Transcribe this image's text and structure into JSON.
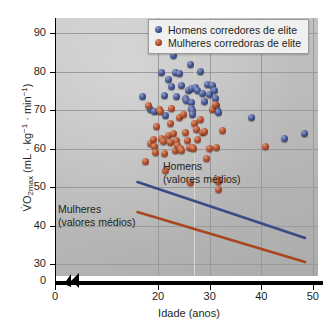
{
  "chart_data": {
    "type": "scatter",
    "title": "",
    "xlabel": "Idade (anos)",
    "ylabel": "V̇O2max (mL · kg⁻¹ · min⁻¹)",
    "ylabel_parts": {
      "prefix": "V̇O",
      "subscript": "2max",
      "unit_open": " (mL · kg",
      "sup1": "−1",
      "mid": " · min",
      "sup2": "−1",
      "close": ")"
    },
    "xlim": [
      0,
      51
    ],
    "ylim": [
      27,
      94
    ],
    "xticks": [
      0,
      20,
      30,
      40,
      50
    ],
    "xtick_labels": [
      "0",
      "20",
      "30",
      "40",
      "50"
    ],
    "yticks": [
      30,
      40,
      50,
      60,
      70,
      80,
      90
    ],
    "ytick_labels": [
      "30",
      "40",
      "50",
      "60",
      "70",
      "80",
      "90"
    ],
    "y_origin_label": "0",
    "axis_break": true,
    "grid": true,
    "legend_position": "top-right",
    "colors": {
      "men": "#3a4a80",
      "women": "#a94a28",
      "men_line": "#3d4a86",
      "women_line": "#a8461f",
      "panel_background": "#bdbdbd",
      "grid": "#9a9a9a",
      "axis": "#000000",
      "text": "#231f20",
      "legend_background": "#f0f0f0"
    },
    "legend": [
      {
        "label": "Homens corredores de elite",
        "marker": "men"
      },
      {
        "label": "Mulheres corredoras de elite",
        "marker": "women"
      }
    ],
    "annotations": [
      {
        "id": "men-trend",
        "line1": "Homens",
        "line2": "(valores médios)"
      },
      {
        "id": "women-trend",
        "line1": "Mulheres",
        "line2": "(valores médios)"
      }
    ],
    "series": [
      {
        "name": "Homens corredores de elite",
        "marker": "men",
        "points": [
          [
            17.0,
            73.6
          ],
          [
            18.6,
            70.2
          ],
          [
            19.3,
            69.8
          ],
          [
            20.3,
            70.0
          ],
          [
            20.6,
            79.8
          ],
          [
            21.2,
            73.9
          ],
          [
            21.4,
            68.8
          ],
          [
            22.0,
            78.0
          ],
          [
            22.6,
            76.3
          ],
          [
            22.9,
            84.2
          ],
          [
            23.3,
            79.8
          ],
          [
            23.6,
            73.5
          ],
          [
            24.2,
            79.7
          ],
          [
            24.6,
            76.5
          ],
          [
            25.2,
            73.2
          ],
          [
            25.5,
            72.5
          ],
          [
            25.9,
            75.3
          ],
          [
            26.2,
            82.0
          ],
          [
            26.4,
            75.6
          ],
          [
            26.5,
            72.0
          ],
          [
            26.5,
            70.6
          ],
          [
            26.6,
            69.9
          ],
          [
            26.7,
            68.9
          ],
          [
            27.3,
            76.0
          ],
          [
            27.6,
            75.2
          ],
          [
            28.2,
            80.2
          ],
          [
            28.5,
            74.5
          ],
          [
            29.0,
            72.4
          ],
          [
            29.5,
            76.8
          ],
          [
            30.0,
            74.1
          ],
          [
            30.6,
            76.6
          ],
          [
            31.0,
            75.3
          ],
          [
            31.2,
            73.0
          ],
          [
            31.4,
            71.3
          ],
          [
            31.5,
            70.1
          ],
          [
            31.6,
            69.6
          ],
          [
            38.0,
            68.1
          ],
          [
            44.4,
            62.8
          ],
          [
            48.4,
            64.1
          ]
        ]
      },
      {
        "name": "Mulheres corredoras de elite",
        "marker": "women",
        "points": [
          [
            17.6,
            56.8
          ],
          [
            18.2,
            71.2
          ],
          [
            18.6,
            61.5
          ],
          [
            19.0,
            62.4
          ],
          [
            19.2,
            60.6
          ],
          [
            19.4,
            59.0
          ],
          [
            19.6,
            65.8
          ],
          [
            20.2,
            70.3
          ],
          [
            20.5,
            69.8
          ],
          [
            20.6,
            62.6
          ],
          [
            21.0,
            61.9
          ],
          [
            21.2,
            58.8
          ],
          [
            21.5,
            54.3
          ],
          [
            22.0,
            63.5
          ],
          [
            22.3,
            66.6
          ],
          [
            22.4,
            61.6
          ],
          [
            22.6,
            70.4
          ],
          [
            23.0,
            64.1
          ],
          [
            23.3,
            59.6
          ],
          [
            23.6,
            62.1
          ],
          [
            23.8,
            60.8
          ],
          [
            24.2,
            68.2
          ],
          [
            24.4,
            60.2
          ],
          [
            24.6,
            59.5
          ],
          [
            25.0,
            69.0
          ],
          [
            25.3,
            64.4
          ],
          [
            25.6,
            62.2
          ],
          [
            26.0,
            60.4
          ],
          [
            26.2,
            51.3
          ],
          [
            26.6,
            60.3
          ],
          [
            26.8,
            60.0
          ],
          [
            27.0,
            66.5
          ],
          [
            27.4,
            65.0
          ],
          [
            27.6,
            62.5
          ],
          [
            28.2,
            67.6
          ],
          [
            28.6,
            64.4
          ],
          [
            29.0,
            64.6
          ],
          [
            29.4,
            57.5
          ],
          [
            30.0,
            60.2
          ],
          [
            30.6,
            70.3
          ],
          [
            31.2,
            71.6
          ],
          [
            31.4,
            60.4
          ],
          [
            31.5,
            52.1
          ],
          [
            31.6,
            51.6
          ],
          [
            31.7,
            49.5
          ],
          [
            32.4,
            64.8
          ],
          [
            40.8,
            60.6
          ]
        ]
      }
    ],
    "trend_lines": [
      {
        "name": "Homens (valores médios)",
        "color": "#3d4a86",
        "x_start": 16.0,
        "y_start": 51.4,
        "x_end": 48.5,
        "y_end": 36.9
      },
      {
        "name": "Mulheres (valores médios)",
        "color": "#a8461f",
        "x_start": 16.0,
        "y_start": 43.6,
        "x_end": 48.5,
        "y_end": 30.6
      }
    ]
  }
}
